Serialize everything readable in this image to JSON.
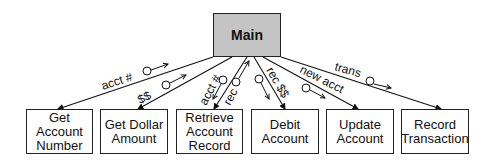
{
  "diagram": {
    "type": "structure-chart",
    "root": {
      "label": "Main",
      "fill": "#c4c4c4"
    },
    "modules": [
      {
        "label": "Get\nAccount\nNumber"
      },
      {
        "label": "Get Dollar\nAmount"
      },
      {
        "label": "Retrieve\nAccount\nRecord"
      },
      {
        "label": "Debit\nAccount"
      },
      {
        "label": "Update\nAccount"
      },
      {
        "label": "Record\nTransaction"
      }
    ],
    "couples": [
      {
        "label": "acct #",
        "direction": "up"
      },
      {
        "label": "$$",
        "direction": "up"
      },
      {
        "label": "acct #",
        "direction": "down"
      },
      {
        "label": "rec",
        "direction": "up"
      },
      {
        "label": "rec $$",
        "direction": "down"
      },
      {
        "label": "new acct",
        "direction": "down"
      },
      {
        "label": "trans",
        "direction": "down"
      }
    ]
  }
}
